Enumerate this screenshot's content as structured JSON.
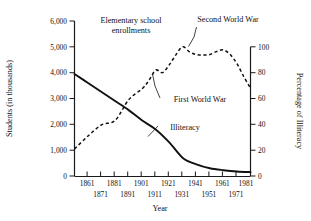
{
  "chart_data": {
    "type": "line",
    "title": "",
    "xlabel": "Year",
    "ylabel": "Students (in thousands)",
    "y2label": "Percentage of Illiteracy",
    "xlim": [
      1861,
      1991
    ],
    "ylim": [
      0,
      6000
    ],
    "y2lim": [
      0,
      100
    ],
    "grid": false,
    "legend_position": "inline-annotations",
    "x_tick_labels_top": [
      "1861",
      "1881",
      "1901",
      "1921",
      "1941",
      "1961",
      "1981"
    ],
    "x_tick_labels_bottom": [
      "1871",
      "1891",
      "1911",
      "1931",
      "1951",
      "1971"
    ],
    "y_tick_labels": [
      "6,000",
      "5,000",
      "4,000",
      "3,000",
      "2,000",
      "1,000",
      "0"
    ],
    "y2_tick_labels": [
      "100",
      "80",
      "60",
      "40",
      "20",
      "0"
    ],
    "series": [
      {
        "name": "Elementary school enrollments",
        "style": "dashed",
        "axis": "left",
        "units": "thousands of students",
        "x": [
          1861,
          1871,
          1881,
          1891,
          1901,
          1911,
          1916,
          1921,
          1926,
          1931,
          1936,
          1941,
          1946,
          1951,
          1956,
          1961,
          1966,
          1971,
          1976,
          1981,
          1986,
          1991
        ],
        "values": [
          1050,
          1550,
          1980,
          2150,
          2950,
          3380,
          3700,
          4100,
          4000,
          4300,
          4700,
          5000,
          4800,
          4700,
          4680,
          4700,
          4820,
          4880,
          4700,
          4350,
          3850,
          3400
        ]
      },
      {
        "name": "Illiteracy",
        "style": "solid",
        "axis": "right",
        "units": "percent",
        "x": [
          1861,
          1871,
          1881,
          1891,
          1901,
          1911,
          1921,
          1931,
          1941,
          1951,
          1961,
          1971,
          1981,
          1991
        ],
        "values": [
          79,
          72,
          65,
          58,
          51,
          43,
          36,
          26,
          14,
          9,
          6,
          4.5,
          3.5,
          3
        ],
        "values_left_scale": [
          3960,
          3600,
          3250,
          2900,
          2550,
          2150,
          1820,
          1320,
          700,
          450,
          320,
          240,
          190,
          160
        ]
      }
    ],
    "annotations": [
      {
        "id": "enrollments-label",
        "text_lines": [
          "Elementary school",
          "enrollments"
        ],
        "target_series": "Elementary school enrollments"
      },
      {
        "id": "second-world-war-label",
        "text_lines": [
          "Second World War"
        ],
        "target_series": "Elementary school enrollments",
        "has_leader_line": true
      },
      {
        "id": "first-world-war-label",
        "text_lines": [
          "First World War"
        ],
        "target_series": "Elementary school enrollments",
        "has_leader_line": true
      },
      {
        "id": "illiteracy-label",
        "text_lines": [
          "Illiteracy"
        ],
        "target_series": "Illiteracy",
        "has_leader_line": true
      }
    ]
  },
  "axes": {
    "left_title": "Students (in thousands)",
    "right_title": "Percentage of Illiteracy",
    "bottom_title": "Year"
  },
  "labels": {
    "y0": "0",
    "y1": "1,000",
    "y2": "2,000",
    "y3": "3,000",
    "y4": "4,000",
    "y5": "5,000",
    "y6": "6,000",
    "r0": "0",
    "r20": "20",
    "r40": "40",
    "r60": "60",
    "r80": "80",
    "r100": "100",
    "x1861": "1861",
    "x1871": "1871",
    "x1881": "1881",
    "x1891": "1891",
    "x1901": "1901",
    "x1911": "1911",
    "x1921": "1921",
    "x1931": "1931",
    "x1941": "1941",
    "x1951": "1951",
    "x1961": "1961",
    "x1971": "1971",
    "x1981": "1981"
  },
  "annotations": {
    "enroll_line1": "Elementary school",
    "enroll_line2": "enrollments",
    "wwii": "Second World War",
    "wwi": "First World War",
    "illiteracy": "Illiteracy"
  }
}
